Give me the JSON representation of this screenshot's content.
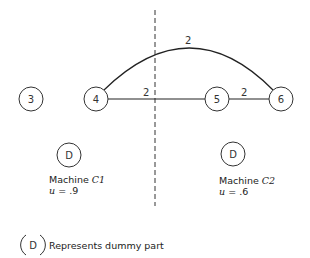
{
  "diagram": {
    "nodes": [
      {
        "id": "3",
        "label": "3",
        "cx": 31,
        "cy": 99
      },
      {
        "id": "4",
        "label": "4",
        "cx": 96,
        "cy": 99
      },
      {
        "id": "5",
        "label": "5",
        "cx": 217,
        "cy": 99
      },
      {
        "id": "6",
        "label": "6",
        "cx": 281,
        "cy": 99
      }
    ],
    "edges": [
      {
        "from": "4",
        "to": "5",
        "weight": "2",
        "type": "straight"
      },
      {
        "from": "5",
        "to": "6",
        "weight": "2",
        "type": "straight"
      },
      {
        "from": "4",
        "to": "6",
        "weight": "2",
        "type": "arc"
      }
    ],
    "divider": {
      "style": "dashed",
      "x": 155
    }
  },
  "machines": [
    {
      "name": "Machine",
      "symbol": "C1",
      "util_label": "u",
      "util_value": ".9",
      "dummy_label": "D"
    },
    {
      "name": "Machine",
      "symbol": "C2",
      "util_label": "u",
      "util_value": ".6",
      "dummy_label": "D"
    }
  ],
  "legend": {
    "symbol": "D",
    "text": "Represents dummy part"
  }
}
